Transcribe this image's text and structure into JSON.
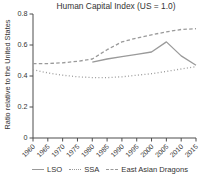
{
  "chart_data": {
    "type": "line",
    "title": "Human Capital Index (US = 1.0)",
    "xlabel": "",
    "ylabel": "Ratio relative to the United States",
    "x": [
      1960,
      1965,
      1970,
      1975,
      1980,
      1985,
      1990,
      1995,
      2000,
      2005,
      2010,
      2015
    ],
    "xtick_labels": [
      "1960",
      "1965",
      "1970",
      "1975",
      "1980",
      "1985",
      "1990",
      "1995",
      "2000",
      "2005",
      "2010",
      "2015"
    ],
    "ylim": [
      0,
      0.8
    ],
    "yticks": [
      0,
      0.2,
      0.4,
      0.6,
      0.8
    ],
    "ytick_labels": [
      "0",
      "0.2",
      "0.4",
      "0.6",
      "0.8"
    ],
    "grid": false,
    "legend_position": "bottom",
    "series": [
      {
        "name": "LSO",
        "style": "solid",
        "values": [
          null,
          null,
          null,
          null,
          0.49,
          0.51,
          0.525,
          0.54,
          0.555,
          0.62,
          0.53,
          0.47
        ]
      },
      {
        "name": "SSA",
        "style": "dotted",
        "values": [
          0.44,
          0.42,
          0.405,
          0.395,
          0.39,
          0.39,
          0.395,
          0.405,
          0.415,
          0.43,
          0.445,
          0.46
        ]
      },
      {
        "name": "East Asian Dragons",
        "style": "dashed",
        "values": [
          0.48,
          0.48,
          0.485,
          0.495,
          0.51,
          0.57,
          0.62,
          0.645,
          0.665,
          0.685,
          0.7,
          0.705
        ]
      }
    ],
    "colors": {
      "line": "#9a9a9a",
      "axis": "#4d4d4d",
      "text": "#333333"
    }
  }
}
